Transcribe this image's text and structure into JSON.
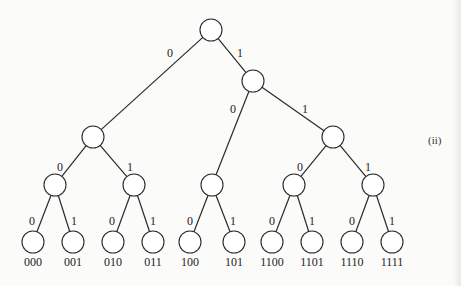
{
  "diagram": {
    "type": "binary-prefix-code-tree",
    "panel_label": "(ii)",
    "node_radius": 11,
    "colors": {
      "line": "#2a2a2a",
      "background": "#fbfbfa",
      "text": "#1e1e1e"
    },
    "nodes": [
      {
        "id": "root",
        "x": 211,
        "y": 30
      },
      {
        "id": "n0",
        "x": 93,
        "y": 137
      },
      {
        "id": "n1",
        "x": 253,
        "y": 81
      },
      {
        "id": "n00",
        "x": 55,
        "y": 185
      },
      {
        "id": "n01",
        "x": 134,
        "y": 185
      },
      {
        "id": "n10",
        "x": 212,
        "y": 185
      },
      {
        "id": "n11",
        "x": 333,
        "y": 137
      },
      {
        "id": "n110",
        "x": 294,
        "y": 185
      },
      {
        "id": "n111",
        "x": 373,
        "y": 185
      },
      {
        "id": "l000",
        "x": 33,
        "y": 242,
        "code": "000"
      },
      {
        "id": "l001",
        "x": 73,
        "y": 242,
        "code": "001"
      },
      {
        "id": "l010",
        "x": 113,
        "y": 242,
        "code": "010"
      },
      {
        "id": "l011",
        "x": 153,
        "y": 242,
        "code": "011"
      },
      {
        "id": "l100",
        "x": 190,
        "y": 242,
        "code": "100"
      },
      {
        "id": "l101",
        "x": 234,
        "y": 242,
        "code": "101"
      },
      {
        "id": "l1100",
        "x": 272,
        "y": 242,
        "code": "1100"
      },
      {
        "id": "l1101",
        "x": 312,
        "y": 242,
        "code": "1101"
      },
      {
        "id": "l1110",
        "x": 352,
        "y": 242,
        "code": "1110"
      },
      {
        "id": "l1111",
        "x": 392,
        "y": 242,
        "code": "1111"
      }
    ],
    "edges": [
      {
        "from": "root",
        "to": "n0",
        "bit": "0",
        "lx": 170,
        "ly": 57
      },
      {
        "from": "root",
        "to": "n1",
        "bit": "1",
        "lx": 240,
        "ly": 57
      },
      {
        "from": "n1",
        "to": "n10",
        "bit": "0",
        "lx": 233,
        "ly": 113
      },
      {
        "from": "n1",
        "to": "n11",
        "bit": "1",
        "lx": 305,
        "ly": 113
      },
      {
        "from": "n0",
        "to": "n00",
        "bit": "0",
        "lx": 60,
        "ly": 171
      },
      {
        "from": "n0",
        "to": "n01",
        "bit": "1",
        "lx": 130,
        "ly": 171
      },
      {
        "from": "n11",
        "to": "n110",
        "bit": "0",
        "lx": 300,
        "ly": 171
      },
      {
        "from": "n11",
        "to": "n111",
        "bit": "1",
        "lx": 368,
        "ly": 171
      },
      {
        "from": "n00",
        "to": "l000",
        "bit": "0",
        "lx": 32,
        "ly": 225
      },
      {
        "from": "n00",
        "to": "l001",
        "bit": "1",
        "lx": 74,
        "ly": 225
      },
      {
        "from": "n01",
        "to": "l010",
        "bit": "0",
        "lx": 112,
        "ly": 225
      },
      {
        "from": "n01",
        "to": "l011",
        "bit": "1",
        "lx": 153,
        "ly": 225
      },
      {
        "from": "n10",
        "to": "l100",
        "bit": "0",
        "lx": 190,
        "ly": 225
      },
      {
        "from": "n10",
        "to": "l101",
        "bit": "1",
        "lx": 233,
        "ly": 225
      },
      {
        "from": "n110",
        "to": "l1100",
        "bit": "0",
        "lx": 272,
        "ly": 225
      },
      {
        "from": "n110",
        "to": "l1101",
        "bit": "1",
        "lx": 312,
        "ly": 225
      },
      {
        "from": "n111",
        "to": "l1110",
        "bit": "0",
        "lx": 352,
        "ly": 225
      },
      {
        "from": "n111",
        "to": "l1111",
        "bit": "1",
        "lx": 392,
        "ly": 225
      }
    ],
    "leaf_codes": [
      "000",
      "001",
      "010",
      "011",
      "100",
      "101",
      "1100",
      "1101",
      "1110",
      "1111"
    ]
  }
}
